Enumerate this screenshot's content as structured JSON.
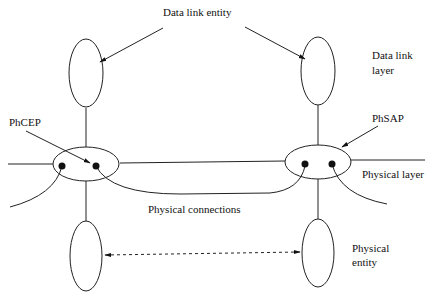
{
  "diagram": {
    "labels": {
      "data_link_entity": "Data link entity",
      "data_link_layer_line1": "Data link",
      "data_link_layer_line2": "layer",
      "phcep": "PhCEP",
      "phsap": "PhSAP",
      "physical_layer": "Physical layer",
      "physical_connections": "Physical connections",
      "physical_entity_line1": "Physical",
      "physical_entity_line2": "entity"
    },
    "nodes": [
      {
        "id": "dl-entity-left",
        "type": "ellipse",
        "role": "data link entity"
      },
      {
        "id": "dl-entity-right",
        "type": "ellipse",
        "role": "data link entity"
      },
      {
        "id": "ph-layer-left",
        "type": "ellipse",
        "role": "physical layer boundary (PhCEPs)"
      },
      {
        "id": "ph-layer-right",
        "type": "ellipse",
        "role": "physical layer boundary (PhSAP)"
      },
      {
        "id": "ph-entity-left",
        "type": "ellipse",
        "role": "physical entity"
      },
      {
        "id": "ph-entity-right",
        "type": "ellipse",
        "role": "physical entity"
      }
    ],
    "edges": [
      {
        "from": "dl-entity-left",
        "to": "ph-layer-left",
        "style": "solid"
      },
      {
        "from": "dl-entity-right",
        "to": "ph-layer-right",
        "style": "solid"
      },
      {
        "from": "ph-layer-left",
        "to": "ph-entity-left",
        "style": "solid"
      },
      {
        "from": "ph-layer-right",
        "to": "ph-entity-right",
        "style": "solid"
      },
      {
        "from": "ph-layer-left",
        "to": "ph-layer-right",
        "style": "solid",
        "label": "Physical connections"
      },
      {
        "from": "ph-entity-left",
        "to": "ph-entity-right",
        "style": "dashed",
        "arrows": "both"
      }
    ]
  }
}
